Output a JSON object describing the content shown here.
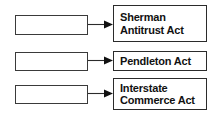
{
  "diagram": {
    "type": "matching-diagram",
    "background_color": "#ffffff",
    "box_border_color": "#2b2b2b",
    "text_color": "#111111",
    "rows": [
      {
        "blank_label": "",
        "blank_placeholder": "",
        "connector": "arrow-right",
        "act_label": "Sherman\nAntitrust Act"
      },
      {
        "blank_label": "",
        "blank_placeholder": "",
        "connector": "arrow-right",
        "act_label": "Pendleton Act"
      },
      {
        "blank_label": "",
        "blank_placeholder": "",
        "connector": "arrow-right",
        "act_label": "Interstate\nCommerce Act"
      }
    ]
  }
}
